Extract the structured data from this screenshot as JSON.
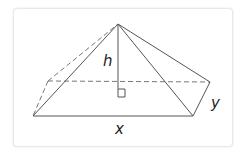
{
  "diagram": {
    "type": "rectangular-pyramid",
    "labels": {
      "height": "h",
      "length": "x",
      "width": "y"
    },
    "colors": {
      "stroke": "#555555",
      "dashed": "#777777",
      "text": "#222222",
      "frame": "#e8e8e8"
    },
    "vertices": {
      "apex": [
        118,
        24
      ],
      "front_left": [
        33,
        116
      ],
      "front_right": [
        193,
        116
      ],
      "back_right": [
        210,
        82
      ],
      "back_left": [
        48,
        81
      ],
      "foot": [
        118,
        82
      ]
    },
    "right_angle_marker": true
  }
}
